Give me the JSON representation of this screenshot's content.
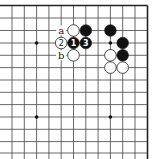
{
  "diagram": {
    "type": "go-board-fragment",
    "grid": {
      "x_lines": [
        12,
        24.3,
        36.6,
        48.9,
        61.2,
        73.5,
        85.8,
        98.1,
        110.4,
        122.7,
        135,
        147.5
      ],
      "y_lines": [
        5.5,
        18,
        30.5,
        43,
        55.3,
        67.6,
        80,
        92.3,
        104.6,
        117,
        129.3,
        141.6,
        153
      ],
      "open_left": true,
      "open_bottom": true,
      "edge_top": true,
      "edge_right": true
    },
    "hoshi": [
      {
        "col": 2,
        "row": 3
      },
      {
        "col": 8,
        "row": 3
      },
      {
        "col": 2,
        "row": 9
      },
      {
        "col": 8,
        "row": 9
      }
    ],
    "stones": [
      {
        "col": 5,
        "row": 2,
        "color": "white",
        "label": ""
      },
      {
        "col": 6,
        "row": 2,
        "color": "black",
        "label": ""
      },
      {
        "col": 8,
        "row": 2,
        "color": "black",
        "label": ""
      },
      {
        "col": 4,
        "row": 3,
        "color": "white",
        "label": "2"
      },
      {
        "col": 5,
        "row": 3,
        "color": "black",
        "label": "1"
      },
      {
        "col": 6,
        "row": 3,
        "color": "black",
        "label": "3"
      },
      {
        "col": 9,
        "row": 3,
        "color": "black",
        "label": ""
      },
      {
        "col": 5,
        "row": 4,
        "color": "white",
        "label": ""
      },
      {
        "col": 8,
        "row": 4,
        "color": "white",
        "label": ""
      },
      {
        "col": 9,
        "row": 4,
        "color": "black",
        "label": ""
      },
      {
        "col": 8,
        "row": 5,
        "color": "white",
        "label": ""
      },
      {
        "col": 9,
        "row": 5,
        "color": "white",
        "label": ""
      }
    ],
    "point_labels": [
      {
        "col": 4,
        "row": 2,
        "text": "a"
      },
      {
        "col": 4,
        "row": 4,
        "text": "b"
      }
    ],
    "colors": {
      "black_stone": "#111111",
      "white_stone": "#ffffff",
      "line": "#444444"
    }
  }
}
